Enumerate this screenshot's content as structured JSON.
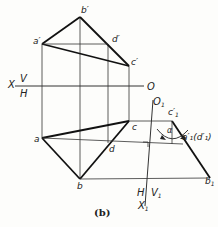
{
  "caption": "(b)",
  "axes": {
    "x_label": "X",
    "v_label": "V",
    "h_label": "H",
    "o_label": "O",
    "o1_label": "O",
    "o1_sub": "1",
    "x1_label": "X",
    "x1_sub": "1",
    "h1_label": "H",
    "v1_label": "V",
    "v1_sub": "1"
  },
  "points": {
    "a_prime": "a′",
    "b_prime": "b′",
    "c_prime": "c′",
    "d_prime": "d′",
    "a": "a",
    "b": "b",
    "c": "c",
    "d": "d",
    "c1_prime": "c",
    "c1_sub": "1",
    "c1_sup": "′",
    "a1d1_prime": "a′₁(d′₁)",
    "b1": "b",
    "b1_sub": "1"
  },
  "angle_label": "α",
  "colors": {
    "line": "#1a1a1a",
    "thin": "#333333",
    "background": "#fdfdfb"
  }
}
